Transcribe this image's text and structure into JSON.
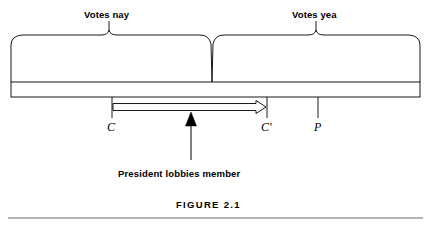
{
  "figure": {
    "caption": "FIGURE 2.1",
    "type": "spatial-voting-diagram",
    "background_color": "#ffffff",
    "line_color": "#000000"
  },
  "braces": [
    {
      "id": "nay",
      "label": "Votes nay",
      "span_start_x": 11,
      "span_end_x": 212,
      "peak_x": 109
    },
    {
      "id": "yea",
      "label": "Votes yea",
      "span_start_x": 212,
      "span_end_x": 420,
      "peak_x": 316
    }
  ],
  "axis": {
    "bar_left_x": 11,
    "bar_right_x": 420,
    "bar_top_y": 82,
    "bar_bottom_y": 97,
    "points": [
      {
        "id": "c",
        "label": "C",
        "x": 112
      },
      {
        "id": "cprime",
        "label": "C'",
        "x": 267
      },
      {
        "id": "p",
        "label": "P",
        "x": 318
      }
    ]
  },
  "arrows": {
    "shift": {
      "id": "preference-shift-arrow",
      "style": "hollow-outline",
      "from_x": 112,
      "to_x": 267,
      "y": 107,
      "direction": "right"
    },
    "lobby": {
      "id": "lobby-arrow",
      "style": "solid-filled",
      "x": 191,
      "from_y": 160,
      "to_y": 113,
      "direction": "up",
      "label": "President lobbies member"
    }
  },
  "rule": {
    "y": 218,
    "left_x": 8,
    "right_x": 423
  }
}
